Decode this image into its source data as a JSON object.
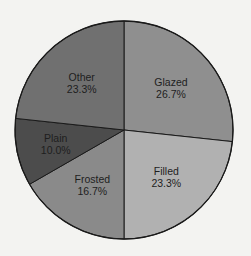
{
  "chart_data": {
    "type": "pie",
    "title": "",
    "start_angle_deg": 0,
    "direction": "clockwise",
    "slices": [
      {
        "label": "Glazed",
        "value": 26.7,
        "value_label": "26.7%",
        "color": "#8f8f8f"
      },
      {
        "label": "Filled",
        "value": 23.3,
        "value_label": "23.3%",
        "color": "#b1b1b1"
      },
      {
        "label": "Frosted",
        "value": 16.7,
        "value_label": "16.7%",
        "color": "#8a8a8a"
      },
      {
        "label": "Plain",
        "value": 10.0,
        "value_label": "10.0%",
        "color": "#4c4c4c"
      },
      {
        "label": "Other",
        "value": 23.3,
        "value_label": "23.3%",
        "color": "#707070"
      }
    ],
    "legend": "none"
  },
  "layout": {
    "center": [
      124,
      130
    ],
    "radius": 109,
    "outline_color": "#1a1a1a",
    "background": "#f3f3f1"
  }
}
